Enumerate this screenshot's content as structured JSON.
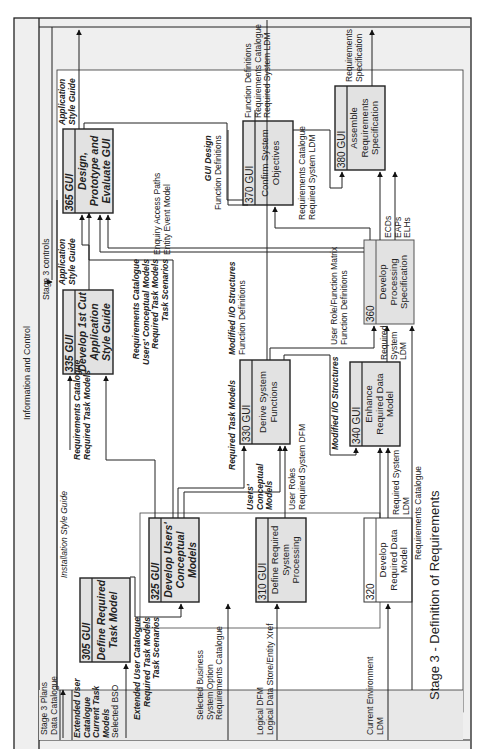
{
  "diagram": {
    "title": "Stage 3 - Definition of Requirements",
    "top_band_label": "Information and Control",
    "stage_controls": "Stage 3 controls",
    "left_inputs": {
      "stage_plans": [
        "Stage 3 Plans",
        "Data Catalogue"
      ]
    },
    "processes": [
      {
        "id": "305 GUI",
        "name": [
          "Define Required",
          "Task Model"
        ],
        "style": "bold-italic"
      },
      {
        "id": "310 GUI",
        "name": [
          "Define Required",
          "System",
          "Processing"
        ],
        "style": "normal"
      },
      {
        "id": "320",
        "name": [
          "Develop",
          "Required Data",
          "Model"
        ],
        "style": "normal"
      },
      {
        "id": "325 GUI",
        "name": [
          "Develop Users'",
          "Conceptual",
          "Models"
        ],
        "style": "bold-italic"
      },
      {
        "id": "330 GUI",
        "name": [
          "Derive System",
          "Functions"
        ],
        "style": "normal"
      },
      {
        "id": "335 GUI",
        "name": [
          "Develop 1st Cut",
          "Application",
          "Style Guide"
        ],
        "style": "bold-italic"
      },
      {
        "id": "340 GUI",
        "name": [
          "Enhance",
          "Required Data",
          "Model"
        ],
        "style": "normal"
      },
      {
        "id": "360",
        "name": [
          "Develop",
          "Processing",
          "Specification"
        ],
        "style": "normal"
      },
      {
        "id": "365 GUI",
        "name": [
          "Design,",
          "Prototype and",
          "Evaluate GUI"
        ],
        "style": "bold-italic"
      },
      {
        "id": "370 GUI",
        "name": [
          "Confirm System",
          "Objectives"
        ],
        "style": "normal"
      },
      {
        "id": "380 GUI",
        "name": [
          "Assemble",
          "Requirements",
          "Specification"
        ],
        "style": "normal"
      }
    ],
    "flow_labels": {
      "installation_style_guide": "Installation Style Guide",
      "in_305": [
        "Extended User",
        "Catalogue",
        "Current Task",
        "Models",
        "Selected BSO"
      ],
      "out_305": [
        "Extended User Catalogue",
        "Required Task Models",
        "Task Scenarios"
      ],
      "in_325_bso": [
        "Selected Business",
        "System Option",
        "Requirements Catalogue"
      ],
      "in_310": [
        "Logical DFM",
        "Logical Data Store/Entity Xref"
      ],
      "in_320": [
        "Current Environment",
        "LDM"
      ],
      "in_335": [
        "Requirements Catalogue",
        "Required Task Models"
      ],
      "out_325": [
        "Requirements Catalogue",
        "Users' Conceptual Models",
        "Required Task Models",
        "Task Scenarios"
      ],
      "out_335": [
        "Application",
        "Style Guide"
      ],
      "in_330_rtm": "Required Task Models",
      "in_330_ucm": [
        "Users'",
        "Conceptual",
        "Models"
      ],
      "in_330_roles": [
        "User Roles",
        "Required System DFM"
      ],
      "out_330": [
        "Modified I/O Structures",
        "Function Definitions"
      ],
      "io_340": "Modified I/O Structures",
      "in_340": [
        "Required System",
        "LDM"
      ],
      "in_360_matrix": [
        "User Role/Function Matrix",
        "Function Definitions"
      ],
      "in_360_ldm": [
        "Required",
        "System",
        "LDM"
      ],
      "req_cat_bottom": "Requirements Catalogue",
      "out_360": [
        "ECDs",
        "EAPs",
        "ELHs"
      ],
      "in_365": [
        "Enquiry Access Paths",
        "Entity Event Model"
      ],
      "gui_design": [
        "GUI Design",
        "Function Definitions"
      ],
      "in_370": [
        "Requirements Catalogue",
        "Required System LDM"
      ],
      "out_370": [
        "Function Definitions",
        "Requirements Catalogue",
        "Required System LDM"
      ],
      "out_365": [
        "Application",
        "Style Guide"
      ],
      "out_380": [
        "Requirements",
        "Specification"
      ]
    }
  }
}
